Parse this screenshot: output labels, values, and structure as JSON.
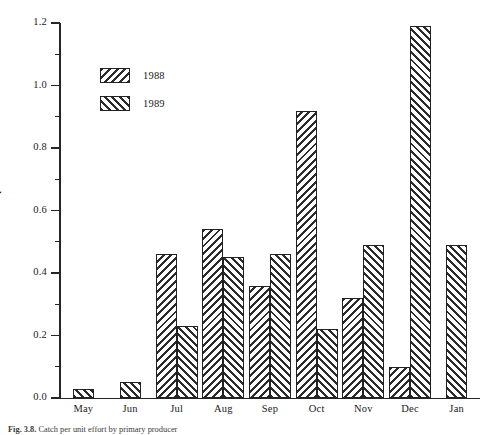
{
  "figure": {
    "caption_prefix": "Fig. 3.8.",
    "caption_text": "Catch per unit effort by primary producer"
  },
  "chart_data": {
    "type": "bar",
    "title": "",
    "xlabel": "",
    "ylabel": "Catch per haul",
    "ylim": [
      0.0,
      1.2
    ],
    "ytick_labels": [
      "0.0",
      "0.2",
      "0.4",
      "0.6",
      "0.8",
      "1.0",
      "1.2"
    ],
    "ytick_values": [
      0.0,
      0.2,
      0.4,
      0.6,
      0.8,
      1.0,
      1.2
    ],
    "yminor_values": [
      0.1,
      0.3,
      0.5,
      0.7,
      0.9,
      1.1
    ],
    "grid": false,
    "legend_position": "upper-left-inside",
    "categories": [
      "May",
      "Jun",
      "Jul",
      "Aug",
      "Sep",
      "Oct",
      "Nov",
      "Dec",
      "Jan"
    ],
    "series": [
      {
        "name": "1988",
        "hatch": "backslash",
        "values": [
          null,
          null,
          0.46,
          0.54,
          0.36,
          0.92,
          0.32,
          0.1,
          null
        ]
      },
      {
        "name": "1989",
        "hatch": "forwardslash",
        "values": [
          0.03,
          0.05,
          0.23,
          0.45,
          0.46,
          0.22,
          0.49,
          1.19,
          0.49
        ]
      }
    ]
  },
  "colors": {
    "axis": "#262626",
    "hatch": "#2b2b2b",
    "bar_fill": "#ffffff",
    "bar_border": "#222222",
    "text": "#1a1a1a",
    "background": "#ffffff"
  }
}
